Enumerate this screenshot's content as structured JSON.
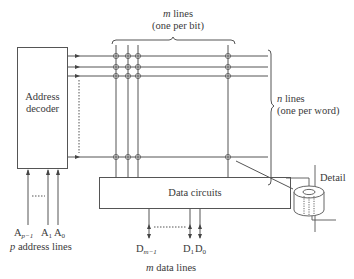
{
  "diagram": {
    "decoder": {
      "label_line1": "Address",
      "label_line2": "decoder"
    },
    "data_circuits": {
      "label": "Data circuits"
    },
    "bit_lines": {
      "label_line1": "m lines",
      "label_line2": "(one per bit)",
      "var": "m",
      "text": "lines"
    },
    "word_lines": {
      "label_line1": "n lines",
      "label_line2": "(one per word)",
      "var": "n",
      "text": "lines"
    },
    "address_lines": {
      "inputs": [
        {
          "base": "A",
          "sub": "p−1"
        },
        {
          "base": "A",
          "sub": "1"
        },
        {
          "base": "A",
          "sub": "0"
        }
      ],
      "caption_var": "p",
      "caption_text": "address lines"
    },
    "data_lines": {
      "outputs": [
        {
          "base": "D",
          "sub": "m−1"
        },
        {
          "base": "D",
          "sub": "1"
        },
        {
          "base": "D",
          "sub": "0"
        }
      ],
      "caption_var": "m",
      "caption_text": "data lines"
    },
    "detail": {
      "label": "Detail"
    },
    "colors": {
      "line": "#555555",
      "text": "#3a3a3a",
      "background": "#ffffff"
    }
  }
}
